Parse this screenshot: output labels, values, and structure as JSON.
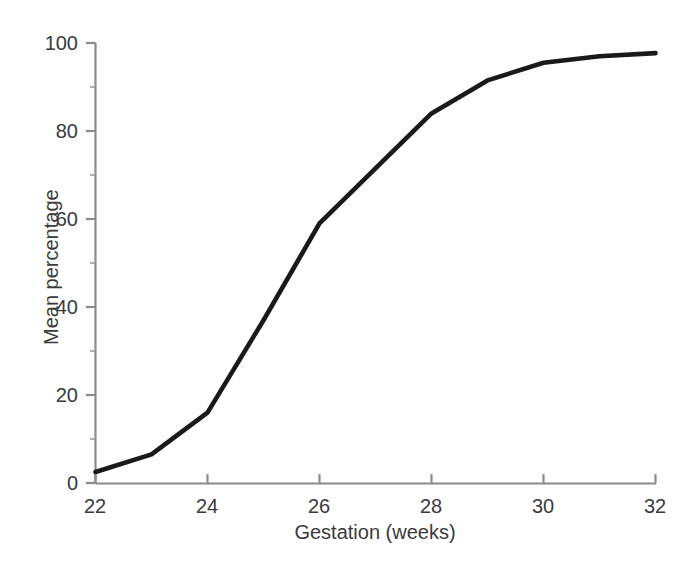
{
  "chart_data": {
    "type": "line",
    "title": "",
    "subtitle": "",
    "xlabel": "Gestation (weeks)",
    "ylabel": "Mean percentage",
    "xlim": [
      22,
      32
    ],
    "ylim": [
      0,
      100
    ],
    "xticks": [
      22,
      24,
      26,
      28,
      30,
      32
    ],
    "xtick_labels": [
      "22",
      "24",
      "26",
      "28",
      "30",
      "32"
    ],
    "yticks": [
      0,
      20,
      40,
      60,
      80,
      100
    ],
    "ytick_labels": [
      "0",
      "20",
      "40",
      "60",
      "80",
      "100"
    ],
    "minor_yticks": [
      10,
      30,
      50,
      70,
      90
    ],
    "grid": false,
    "legend": false,
    "legend_position": "none",
    "line_color": "#1a1a1a",
    "axis_color": "#8a8a8a",
    "background_color": "#ffffff",
    "x": [
      22,
      23,
      24,
      25,
      26,
      27,
      28,
      29,
      30,
      31,
      32
    ],
    "series": [
      {
        "name": "Mean percentage",
        "values": [
          2.5,
          6.5,
          16,
          37,
          59,
          71.5,
          84,
          91.5,
          95.5,
          97,
          97.7
        ]
      }
    ]
  },
  "axes": {
    "y_label_text": "Mean percentage",
    "x_label_text": "Gestation (weeks)",
    "y_tick_texts": [
      "100",
      "80",
      "60",
      "40",
      "20",
      "0"
    ],
    "x_tick_texts": [
      "22",
      "24",
      "26",
      "28",
      "30",
      "32"
    ]
  },
  "caption": {
    "partial_text": ""
  }
}
